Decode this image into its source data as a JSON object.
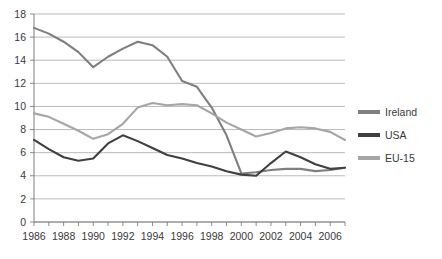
{
  "chart_data": {
    "type": "line",
    "title": "",
    "xlabel": "",
    "ylabel": "",
    "xlim": [
      1986,
      2007
    ],
    "ylim": [
      0,
      18
    ],
    "ytick_step": 2,
    "grid": true,
    "legend_position": "right",
    "x": [
      1986,
      1987,
      1988,
      1989,
      1990,
      1991,
      1992,
      1993,
      1994,
      1995,
      1996,
      1997,
      1998,
      1999,
      2000,
      2001,
      2002,
      2003,
      2004,
      2005,
      2006,
      2007
    ],
    "xtick_labels": [
      "1986",
      "1988",
      "1990",
      "1992",
      "1994",
      "1996",
      "1998",
      "2000",
      "2002",
      "2004",
      "2006"
    ],
    "ytick_labels": [
      "0",
      "2",
      "4",
      "6",
      "8",
      "10",
      "12",
      "14",
      "16",
      "18"
    ],
    "series": [
      {
        "name": "Ireland",
        "color": "#7f7f7f",
        "values": [
          16.8,
          16.3,
          15.6,
          14.7,
          13.4,
          14.3,
          15.0,
          15.6,
          15.3,
          14.3,
          12.2,
          11.7,
          9.9,
          7.5,
          4.2,
          4.3,
          4.5,
          4.6,
          4.6,
          4.4,
          4.5,
          4.7
        ]
      },
      {
        "name": "USA",
        "color": "#404040",
        "values": [
          7.1,
          6.3,
          5.6,
          5.3,
          5.5,
          6.8,
          7.5,
          7.0,
          6.4,
          5.8,
          5.5,
          5.1,
          4.8,
          4.4,
          4.1,
          4.0,
          5.1,
          6.1,
          5.6,
          5.0,
          4.6,
          4.7
        ]
      },
      {
        "name": "EU-15",
        "color": "#a6a6a6",
        "values": [
          9.4,
          9.1,
          8.5,
          7.9,
          7.2,
          7.6,
          8.5,
          9.9,
          10.3,
          10.1,
          10.2,
          10.1,
          9.4,
          8.6,
          8.0,
          7.4,
          7.7,
          8.1,
          8.2,
          8.1,
          7.8,
          7.1
        ]
      }
    ]
  },
  "legend": {
    "items": [
      {
        "label": "Ireland"
      },
      {
        "label": "USA"
      },
      {
        "label": "EU-15"
      }
    ]
  }
}
